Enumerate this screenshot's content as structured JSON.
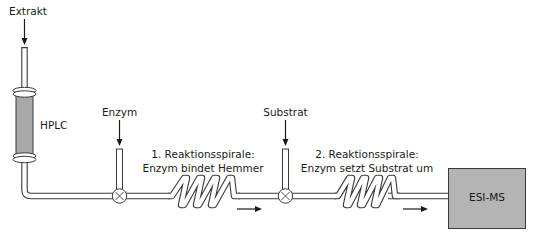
{
  "diagram": {
    "labels": {
      "extract": "Extrakt",
      "hplc": "HPLC",
      "enzyme": "Enzym",
      "substrate": "Substrat",
      "coil1_line1": "1. Reaktionsspirale:",
      "coil1_line2": "Enzym bindet Hemmer",
      "coil2_line1": "2. Reaktionsspirale:",
      "coil2_line2": "Enzym setzt Substrat um",
      "detector": "ESI-MS"
    },
    "components": [
      {
        "id": "extract-inlet",
        "type": "inlet-arrow"
      },
      {
        "id": "hplc-column",
        "type": "column"
      },
      {
        "id": "enzyme-inlet",
        "type": "inlet-arrow"
      },
      {
        "id": "mixing-valve-1",
        "type": "t-junction"
      },
      {
        "id": "reaction-coil-1",
        "type": "coil",
        "loops": 4
      },
      {
        "id": "flow-arrow-1",
        "type": "flow-direction"
      },
      {
        "id": "substrate-inlet",
        "type": "inlet-arrow"
      },
      {
        "id": "mixing-valve-2",
        "type": "t-junction"
      },
      {
        "id": "reaction-coil-2",
        "type": "coil",
        "loops": 4
      },
      {
        "id": "flow-arrow-2",
        "type": "flow-direction"
      },
      {
        "id": "esi-ms-detector",
        "type": "box"
      }
    ],
    "colors": {
      "column_fill": "#a9a9a9",
      "detector_fill": "#b4b4b4",
      "stroke": "#3a3a3a",
      "background": "#ffffff"
    }
  }
}
